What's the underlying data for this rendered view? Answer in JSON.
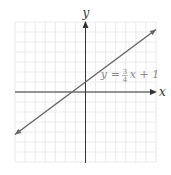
{
  "chart_data": {
    "type": "line",
    "title": "",
    "xlabel": "x",
    "ylabel": "y",
    "xlim": [
      -7,
      7
    ],
    "ylim": [
      -7,
      7
    ],
    "grid": true,
    "series": [
      {
        "name": "y = 3/4 x + 1",
        "slope": 0.75,
        "intercept": 1,
        "x": [
          -7,
          7
        ],
        "y": [
          -4.25,
          6.25
        ],
        "arrows": "both"
      }
    ],
    "annotation": {
      "lhs": "y",
      "eq": "=",
      "numerator": "3",
      "denominator": "4",
      "rhs": "x + 1",
      "at": [
        4.5,
        1.8
      ]
    },
    "colors": {
      "grid": "#e4e4e4",
      "axis": "#333333",
      "line": "#666666",
      "annotation": "#888888"
    }
  }
}
